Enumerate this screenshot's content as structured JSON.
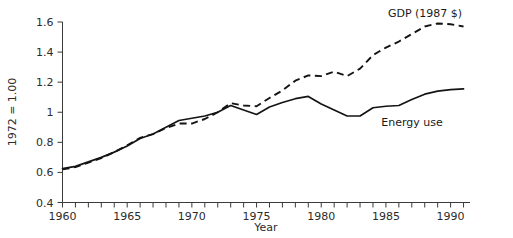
{
  "chart_data": {
    "type": "line",
    "title": "",
    "xlabel": "Year",
    "ylabel": "1972 = 1.00",
    "xlim": [
      1960,
      1991.5
    ],
    "ylim": [
      0.4,
      1.6
    ],
    "grid": false,
    "legend_position": "inline-annotation",
    "x_tick_labels": [
      "1960",
      "1965",
      "1970",
      "1975",
      "1980",
      "1985",
      "1990"
    ],
    "x_tick_values": [
      1960,
      1965,
      1970,
      1975,
      1980,
      1985,
      1990
    ],
    "x_minor_tick_step": 1,
    "y_tick_labels": [
      "0.4",
      "0.6",
      "0.8",
      "1",
      "1.2",
      "1.4",
      "1.6"
    ],
    "y_tick_values": [
      0.4,
      0.6,
      0.8,
      1.0,
      1.2,
      1.4,
      1.6
    ],
    "x": [
      1960,
      1961,
      1962,
      1963,
      1964,
      1965,
      1966,
      1967,
      1968,
      1969,
      1970,
      1971,
      1972,
      1973,
      1974,
      1975,
      1976,
      1977,
      1978,
      1979,
      1980,
      1981,
      1982,
      1983,
      1984,
      1985,
      1986,
      1987,
      1988,
      1989,
      1990,
      1991
    ],
    "series": [
      {
        "name": "GDP (1987 $)",
        "style": "dashed",
        "color": "#141414",
        "label_text": "GDP (1987 $)",
        "values": [
          0.62,
          0.635,
          0.665,
          0.695,
          0.735,
          0.78,
          0.83,
          0.855,
          0.895,
          0.925,
          0.925,
          0.955,
          1.0,
          1.06,
          1.045,
          1.04,
          1.095,
          1.145,
          1.21,
          1.245,
          1.24,
          1.27,
          1.24,
          1.29,
          1.38,
          1.43,
          1.47,
          1.52,
          1.57,
          1.59,
          1.585,
          1.57
        ]
      },
      {
        "name": "Energy use",
        "style": "solid",
        "color": "#141414",
        "label_text": "Energy use",
        "values": [
          0.625,
          0.64,
          0.67,
          0.7,
          0.735,
          0.775,
          0.825,
          0.855,
          0.9,
          0.945,
          0.96,
          0.975,
          1.0,
          1.045,
          1.015,
          0.985,
          1.035,
          1.065,
          1.09,
          1.105,
          1.055,
          1.015,
          0.975,
          0.975,
          1.03,
          1.04,
          1.045,
          1.085,
          1.12,
          1.14,
          1.15,
          1.155
        ]
      }
    ],
    "annotations": [
      {
        "id": "gdp-label",
        "text": "GDP (1987 $)",
        "x_px": 425,
        "y_px": 17,
        "anchor": "middle"
      },
      {
        "id": "energy-label",
        "text": "Energy use",
        "x_px": 412,
        "y_px": 126,
        "anchor": "middle"
      }
    ]
  }
}
